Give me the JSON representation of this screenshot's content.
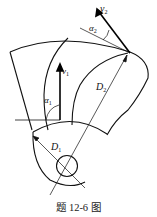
{
  "figure": {
    "caption": "题 12-6 图",
    "labels": {
      "v1": {
        "main": "v",
        "sub": "1"
      },
      "v2": {
        "main": "v",
        "sub": "2"
      },
      "alpha1": {
        "main": "α",
        "sub": "1"
      },
      "alpha2": {
        "main": "α",
        "sub": "2"
      },
      "D1": {
        "main": "D",
        "sub": "1"
      },
      "D2": {
        "main": "D",
        "sub": "2"
      }
    },
    "colors": {
      "line": "#111111",
      "background": "#ffffff"
    }
  }
}
